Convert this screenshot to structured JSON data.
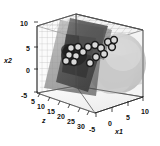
{
  "figure": {
    "title": "",
    "background_color": "#ffffff",
    "marker_edge_color": "#1a1a1a",
    "marker_face_color": "#d8d8d8",
    "box_line_color": "#4a4a4a",
    "grid_mesh_color": "#7a7a7a",
    "dark_surface_color": "#3c3c3c",
    "light_surface_color": "#c9c9c9"
  },
  "axes": {
    "x1": {
      "label": "x1",
      "ticks": [
        "-5",
        "0",
        "5",
        "10"
      ],
      "tick_values": [
        -5,
        0,
        5,
        10
      ],
      "range": [
        -7,
        12
      ]
    },
    "x2": {
      "label": "x2",
      "ticks": [
        "-5",
        "0",
        "5",
        "10"
      ],
      "tick_values": [
        -5,
        0,
        5,
        10
      ],
      "range": [
        -6,
        12
      ]
    },
    "z": {
      "label": "z",
      "ticks": [
        "5",
        "10",
        "15",
        "20",
        "25",
        "30"
      ],
      "tick_values": [
        5,
        10,
        15,
        20,
        25,
        30
      ],
      "range": [
        2,
        32
      ]
    }
  },
  "chart_data": {
    "type": "scatter",
    "title": "",
    "xlabel": "x1",
    "ylabel": "x2",
    "zlabel": "z",
    "projection": "3d",
    "grid": true,
    "legend": null,
    "xlim": [
      -7,
      12
    ],
    "ylim": [
      -6,
      12
    ],
    "zlim": [
      2,
      32
    ],
    "marker": "open-circle",
    "series": [
      {
        "name": "observations",
        "points": [
          {
            "px": 71,
            "py": 48,
            "r": 3.4
          },
          {
            "px": 78,
            "py": 47,
            "r": 3.4
          },
          {
            "px": 69,
            "py": 55,
            "r": 3.4
          },
          {
            "px": 76,
            "py": 56,
            "r": 3.4
          },
          {
            "px": 83,
            "py": 52,
            "r": 3.4
          },
          {
            "px": 88,
            "py": 47,
            "r": 3.4
          },
          {
            "px": 95,
            "py": 45,
            "r": 3.4
          },
          {
            "px": 101,
            "py": 48,
            "r": 3.4
          },
          {
            "px": 108,
            "py": 42,
            "r": 3.4
          },
          {
            "px": 114,
            "py": 40,
            "r": 3.4
          },
          {
            "px": 112,
            "py": 47,
            "r": 3.4
          },
          {
            "px": 104,
            "py": 54,
            "r": 3.4
          },
          {
            "px": 96,
            "py": 57,
            "r": 3.4
          },
          {
            "px": 90,
            "py": 63,
            "r": 3.4
          },
          {
            "px": 74,
            "py": 62,
            "r": 3.4
          },
          {
            "px": 66,
            "py": 61,
            "r": 3.4
          }
        ]
      }
    ],
    "surfaces": [
      {
        "name": "wireframe-grid-plane",
        "style": "mesh",
        "shade": "#7a7a7a"
      },
      {
        "name": "dark-fitted-plane",
        "style": "filled",
        "shade": "#3c3c3c"
      },
      {
        "name": "light-response-surface",
        "style": "filled",
        "shade": "#c9c9c9"
      }
    ]
  },
  "tick_labels": {
    "x2": [
      {
        "text": "10",
        "x": 20,
        "y": 20
      },
      {
        "text": "5",
        "x": 26,
        "y": 45
      },
      {
        "text": "0",
        "x": 26,
        "y": 67
      },
      {
        "text": "-5",
        "x": 21,
        "y": 92
      }
    ],
    "z": [
      {
        "text": "5",
        "x": 31,
        "y": 98
      },
      {
        "text": "10",
        "x": 37,
        "y": 103
      },
      {
        "text": "15",
        "x": 47,
        "y": 108
      },
      {
        "text": "20",
        "x": 57,
        "y": 113
      },
      {
        "text": "25",
        "x": 67,
        "y": 118
      },
      {
        "text": "30",
        "x": 77,
        "y": 123
      }
    ],
    "x1": [
      {
        "text": "-5",
        "x": 89,
        "y": 126
      },
      {
        "text": "0",
        "x": 108,
        "y": 120
      },
      {
        "text": "5",
        "x": 126,
        "y": 114
      },
      {
        "text": "10",
        "x": 141,
        "y": 108
      }
    ]
  },
  "axis_titles": {
    "x2": {
      "text": "x2",
      "x": 4,
      "y": 57
    },
    "z": {
      "text": "z",
      "x": 42,
      "y": 117
    },
    "x1": {
      "text": "x1",
      "x": 115,
      "y": 128
    }
  }
}
